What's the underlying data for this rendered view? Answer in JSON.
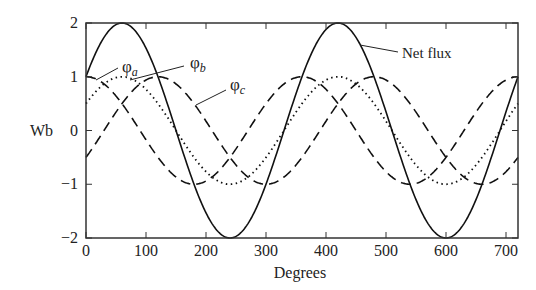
{
  "chart_data": {
    "type": "line",
    "title": "",
    "xlabel": "Degrees",
    "ylabel": "Wb",
    "xlim": [
      0,
      720
    ],
    "ylim": [
      -2,
      2
    ],
    "xticks": [
      0,
      100,
      200,
      300,
      400,
      500,
      600,
      700
    ],
    "yticks": [
      2,
      1,
      0,
      -1,
      -2
    ],
    "grid": false,
    "series": [
      {
        "name": "φa",
        "style": "dashed",
        "formula": "cos(θ)"
      },
      {
        "name": "φb",
        "style": "dotted",
        "formula": "cos(θ-60°)"
      },
      {
        "name": "φc",
        "style": "dashed",
        "formula": "cos(θ-120°)"
      },
      {
        "name": "Net flux",
        "style": "solid",
        "formula": "2cos(θ-60°)"
      }
    ],
    "annotations": [
      "φa",
      "φb",
      "φc",
      "Net flux"
    ]
  }
}
